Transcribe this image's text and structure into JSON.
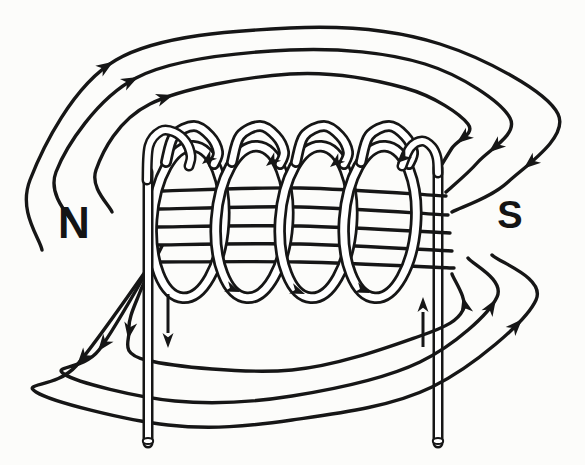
{
  "diagram": {
    "canvas": {
      "w": 585,
      "h": 465
    },
    "colors": {
      "ink": "#161616",
      "paper": "#fcfcfa",
      "tube_fill": "#ffffff"
    },
    "labels": {
      "north": "N",
      "south": "S",
      "north_pos": {
        "x": 74,
        "y": 238,
        "size": 44
      },
      "south_pos": {
        "x": 510,
        "y": 228,
        "size": 38
      }
    },
    "field": {
      "stroke_width": 3.4,
      "interior_lines": [
        [
          [
            163,
            191
          ],
          [
            300,
            188
          ],
          [
            446,
            196
          ]
        ],
        [
          [
            159,
            209
          ],
          [
            300,
            207
          ],
          [
            448,
            215
          ]
        ],
        [
          [
            156,
            227
          ],
          [
            300,
            226
          ],
          [
            450,
            233
          ]
        ],
        [
          [
            154,
            245
          ],
          [
            300,
            244
          ],
          [
            452,
            251
          ]
        ],
        [
          [
            152,
            262
          ],
          [
            300,
            262
          ],
          [
            454,
            268
          ]
        ]
      ],
      "loops": [
        {
          "id": "upper-inner",
          "pts": [
            [
              112,
              212
            ],
            [
              96,
              170
            ],
            [
              150,
              104
            ],
            [
              290,
              74
            ],
            [
              405,
              88
            ],
            [
              468,
              124
            ],
            [
              452,
              148
            ],
            [
              436,
              174
            ]
          ]
        },
        {
          "id": "upper-middle",
          "pts": [
            [
              78,
              230
            ],
            [
              56,
              172
            ],
            [
              136,
              78
            ],
            [
              290,
              50
            ],
            [
              425,
              64
            ],
            [
              510,
              118
            ],
            [
              478,
              162
            ],
            [
              446,
              192
            ]
          ]
        },
        {
          "id": "upper-outer",
          "pts": [
            [
              42,
              250
            ],
            [
              30,
              180
            ],
            [
              116,
              60
            ],
            [
              290,
              28
            ],
            [
              440,
              44
            ],
            [
              558,
              114
            ],
            [
              508,
              182
            ],
            [
              452,
              212
            ]
          ]
        },
        {
          "id": "lower-inner",
          "pts": [
            [
              162,
              246
            ],
            [
              140,
              292
            ],
            [
              129,
              330
            ],
            [
              146,
              360
            ],
            [
              292,
              370
            ],
            [
              420,
              336
            ],
            [
              463,
              310
            ],
            [
              452,
              274
            ]
          ]
        },
        {
          "id": "lower-middle",
          "pts": [
            [
              158,
              252
            ],
            [
              99,
              350
            ],
            [
              64,
              374
            ],
            [
              175,
              401
            ],
            [
              292,
              396
            ],
            [
              420,
              362
            ],
            [
              497,
              297
            ],
            [
              468,
              258
            ]
          ]
        },
        {
          "id": "lower-outer",
          "pts": [
            [
              155,
              258
            ],
            [
              76,
              366
            ],
            [
              36,
              392
            ],
            [
              168,
              425
            ],
            [
              292,
              420
            ],
            [
              432,
              387
            ],
            [
              536,
              300
            ],
            [
              492,
              255
            ]
          ]
        }
      ],
      "loop_arrows": [
        {
          "line": 0,
          "frac": 0.3
        },
        {
          "line": 0,
          "frac": 0.93
        },
        {
          "line": 1,
          "frac": 0.28
        },
        {
          "line": 1,
          "frac": 0.915
        },
        {
          "line": 2,
          "frac": 0.26
        },
        {
          "line": 2,
          "frac": 0.9
        },
        {
          "line": 3,
          "frac": 0.2
        },
        {
          "line": 3,
          "frac": 0.95
        },
        {
          "line": 4,
          "frac": 0.17
        },
        {
          "line": 4,
          "frac": 0.92
        },
        {
          "line": 5,
          "frac": 0.165
        },
        {
          "line": 5,
          "frac": 0.885
        }
      ],
      "arrow_len": 17,
      "arrow_w": 6.5
    },
    "coil": {
      "turn_centers": [
        188,
        252,
        316,
        380
      ],
      "cy": 222,
      "rx": 36,
      "ry": 76,
      "tilt": 4,
      "tube_outer": 12.5,
      "tube_inner": 7,
      "hump_centers": [
        192,
        258,
        322,
        387
      ],
      "turn_arrows_top": {
        "tips": [
          [
            202,
            164
          ],
          [
            266,
            166
          ],
          [
            330,
            167
          ],
          [
            397,
            163
          ]
        ],
        "dir": [
          -0.78,
          0.63
        ]
      },
      "turn_arrows_bottom": {
        "tips": [
          [
            240,
            292
          ],
          [
            305,
            294
          ],
          [
            370,
            293
          ]
        ],
        "dir": [
          0.93,
          0.37
        ]
      },
      "turn_arrow_len": 15,
      "turn_arrow_w": 5.5
    },
    "leads": {
      "tube_outer": 11,
      "tube_inner": 6,
      "left_vertical": [
        [
          148,
          443
        ],
        [
          148,
          172
        ]
      ],
      "left_bend": [
        [
          147,
          180
        ],
        [
          149,
          146
        ],
        [
          161,
          131
        ],
        [
          174,
          132
        ],
        [
          186,
          142
        ],
        [
          191,
          156
        ],
        [
          189,
          166
        ]
      ],
      "right_vertical": [
        [
          438,
          443
        ],
        [
          438,
          168
        ]
      ],
      "right_bend": [
        [
          402,
          166
        ],
        [
          410,
          148
        ],
        [
          422,
          141
        ],
        [
          432,
          147
        ],
        [
          437,
          158
        ],
        [
          438,
          173
        ]
      ],
      "cap": {
        "rx": 5.2,
        "ry": 3.1,
        "left": [
          148,
          441
        ],
        "right": [
          438,
          441
        ]
      }
    },
    "current_arrows": [
      {
        "name": "current-down-arrow",
        "shaft": [
          [
            168,
            294
          ],
          [
            168,
            333
          ]
        ],
        "tip": [
          168,
          348
        ],
        "dir": [
          0,
          1
        ]
      },
      {
        "name": "current-up-arrow",
        "shaft": [
          [
            423,
            347
          ],
          [
            423,
            312
          ]
        ],
        "tip": [
          423,
          297
        ],
        "dir": [
          0,
          -1
        ]
      }
    ],
    "current_arrow_len": 15,
    "current_arrow_w": 5.5
  }
}
